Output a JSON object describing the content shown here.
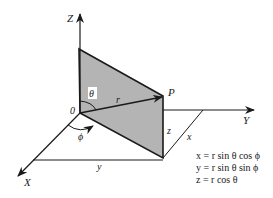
{
  "diagram": {
    "type": "spherical-coordinates",
    "axes": {
      "z_label": "Z",
      "y_label": "Y",
      "x_label": "X",
      "origin_label": "0"
    },
    "labels": {
      "point": "P",
      "radius": "r",
      "theta": "θ",
      "phi": "ϕ",
      "z_component": "z",
      "x_component": "x",
      "y_component": "y"
    },
    "equations": [
      "x = r sin θ cos ϕ",
      "y = r sin θ sin ϕ",
      "z = r cos θ"
    ],
    "colors": {
      "line": "#1a1a1a",
      "plane_fill": "#b4b4b4",
      "background": "#ffffff"
    }
  }
}
